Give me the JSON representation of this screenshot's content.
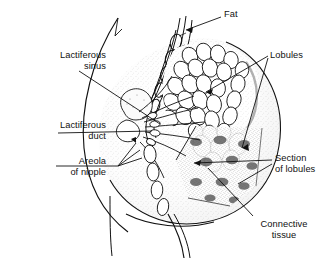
{
  "figure": {
    "background_color": "#ffffff",
    "ink_color": "#111111"
  },
  "labels": {
    "lactiferous_sinus": "Lactiferous\nsinus",
    "lactiferous_duct": "Lactiferous\nduct",
    "areola_of_nipple": "Areola\nof nipple",
    "fat": "Fat",
    "lobules": "Lobules",
    "section_of_lobules": "Section\nof lobules",
    "connective_tissue": "Connective\ntissue"
  },
  "anatomy_parts": [
    {
      "name": "lactiferous-sinus",
      "label": "Lactiferous sinus",
      "side": "left"
    },
    {
      "name": "lactiferous-duct",
      "label": "Lactiferous duct",
      "side": "left"
    },
    {
      "name": "areola-of-nipple",
      "label": "Areola of nipple",
      "side": "left"
    },
    {
      "name": "fat",
      "label": "Fat",
      "side": "right"
    },
    {
      "name": "lobules",
      "label": "Lobules",
      "side": "right"
    },
    {
      "name": "section-of-lobules",
      "label": "Section of lobules",
      "side": "right"
    },
    {
      "name": "connective-tissue",
      "label": "Connective tissue",
      "side": "right"
    }
  ]
}
